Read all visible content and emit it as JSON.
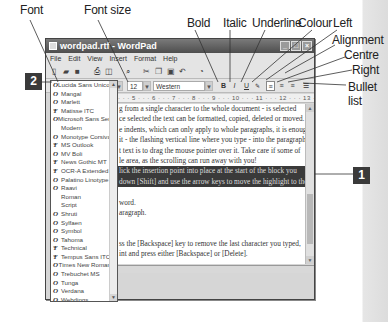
{
  "annotations": {
    "font": "Font",
    "font_size": "Font size",
    "bold": "Bold",
    "italic": "Italic",
    "underline": "Underline",
    "colour": "Colour",
    "left": "Left",
    "alignment": "Alignment",
    "centre": "Centre",
    "right": "Right",
    "bullet_list_1": "Bullet",
    "bullet_list_2": "list",
    "badge_1": "1",
    "badge_2": "2"
  },
  "window": {
    "title": "wordpad.rtf - WordPad",
    "buttons": [
      "_",
      "□",
      "×"
    ]
  },
  "menu": [
    "File",
    "Edit",
    "View",
    "Insert",
    "Format",
    "Help"
  ],
  "toolbar": {
    "icons": [
      "new-icon",
      "open-icon",
      "save-icon",
      "print-icon",
      "print-preview-icon",
      "find-icon",
      "cut-icon",
      "copy-icon",
      "paste-icon",
      "undo-icon",
      "insert-datetime-icon"
    ]
  },
  "format_bar": {
    "font_value": "Times New Roman",
    "size_value": "12",
    "script_value": "Western",
    "bold_label": "B",
    "italic_label": "I",
    "underline_label": "U",
    "colour_label": "🎨",
    "align_left": "≡",
    "align_center": "≡",
    "align_right": "≡",
    "bullets": "☰"
  },
  "ruler": "· · · 5 · · · 6 · · · 7 · · · 8 · · · 9 · · · 10 · · · 11 · · · 12 · · · 13 · · · 14 · ·",
  "document": {
    "lines": [
      "g from a single character to the whole document - is selected",
      "ce selected the text can be formatted, copied, deleted or moved.",
      "e indents, which can only apply to whole paragraphs, it is enough",
      "it - the flashing vertical line where you type - into the paragraph.",
      "t text is to drag the mouse pointer over it. Take care if some of",
      "le area, as the scrolling can run away with you!",
      "lick the insertion point into place at the start of the block you",
      "down [Shift] and use the arrow keys to move the highlight to the",
      "",
      "word.",
      "aragraph.",
      "",
      "",
      "ss the [Backspace] key to remove the last character you typed,",
      "int and press either [Backspace] or [Delete]."
    ],
    "highlighted_lines": [
      6,
      7
    ]
  },
  "font_list": [
    {
      "name": "Lucida Sans Unicode",
      "type": "O"
    },
    {
      "name": "Mangal",
      "type": "O"
    },
    {
      "name": "Marlett",
      "type": "O"
    },
    {
      "name": "Matisse ITC",
      "type": "T"
    },
    {
      "name": "Microsoft Sans Serif",
      "type": "O"
    },
    {
      "name": "Modern",
      "type": ""
    },
    {
      "name": "Monotype Corsiva",
      "type": "O"
    },
    {
      "name": "MS Outlook",
      "type": "T"
    },
    {
      "name": "MV Boli",
      "type": "O"
    },
    {
      "name": "News Gothic MT",
      "type": "T"
    },
    {
      "name": "OCR-A Extended",
      "type": "T"
    },
    {
      "name": "Palatino Linotype",
      "type": "O"
    },
    {
      "name": "Raavi",
      "type": "O"
    },
    {
      "name": "Roman",
      "type": ""
    },
    {
      "name": "Script",
      "type": ""
    },
    {
      "name": "Shruti",
      "type": "O"
    },
    {
      "name": "Sylfaen",
      "type": "O"
    },
    {
      "name": "Symbol",
      "type": "O"
    },
    {
      "name": "Tahoma",
      "type": "O"
    },
    {
      "name": "Technical",
      "type": "T"
    },
    {
      "name": "Tempus Sans ITC",
      "type": "T"
    },
    {
      "name": "Times New Roman",
      "type": "O"
    },
    {
      "name": "Trebuchet MS",
      "type": "O"
    },
    {
      "name": "Tunga",
      "type": "O"
    },
    {
      "name": "Verdana",
      "type": "O"
    },
    {
      "name": "Webdings",
      "type": "O"
    },
    {
      "name": "Wiedsmaster",
      "type": "T"
    },
    {
      "name": "Wingdings",
      "type": "O"
    },
    {
      "name": "Wingdings 2",
      "type": "T"
    },
    {
      "name": "Wingdings 3",
      "type": "T"
    }
  ],
  "font_list_selected_index": 26
}
